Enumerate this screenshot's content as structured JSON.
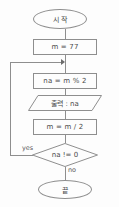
{
  "diagram": {
    "colors": {
      "stroke": "#8e8e8e",
      "text": "#4a4a4a",
      "background": "#fdfdfd",
      "arrow": "#6b6b6b"
    },
    "nodes": {
      "start": {
        "label": "시 작",
        "shape": "terminator"
      },
      "init": {
        "label": "m = 77",
        "shape": "process"
      },
      "mod": {
        "label": "na = m % 2",
        "shape": "process"
      },
      "output": {
        "label": "출력 : na",
        "shape": "parallelogram"
      },
      "divide": {
        "label": "m = m / 2",
        "shape": "process"
      },
      "decision": {
        "label": "na != 0",
        "shape": "diamond"
      },
      "end": {
        "label": "끝",
        "shape": "terminator"
      }
    },
    "edge_labels": {
      "yes": "yes",
      "no": "no"
    }
  }
}
